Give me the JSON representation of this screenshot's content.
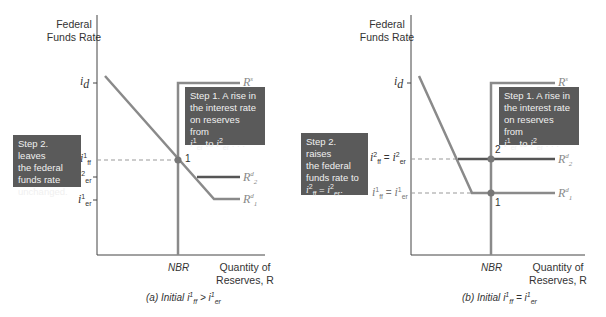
{
  "top_fragment": "",
  "panel_a": {
    "y_axis_title_line1": "Federal",
    "y_axis_title_line2": "Funds Rate",
    "x_axis_title_line1": "Quantity of",
    "x_axis_title_line2": "Reserves, R",
    "nbr_label": "NBR",
    "id_label": "i",
    "id_sub": "d",
    "iff1_label": "i",
    "iff1_sup": "1",
    "iff1_sub": "ff",
    "ier2_label": "i",
    "ier2_sup": "2",
    "ier2_sub": "er",
    "ier1_label": "i",
    "ier1_sup": "1",
    "ier1_sub": "er",
    "rs_label": "R",
    "rs_sup": "s",
    "r2d_label": "R",
    "r2d_sub": "2",
    "r2d_sup": "d",
    "r1d_label": "R",
    "r1d_sub": "1",
    "r1d_sup": "d",
    "point1": "1",
    "step1_box": {
      "line1": "Step 1. A rise in",
      "line2": "the interest rate",
      "line3": "on reserves from",
      "line4_a": "i",
      "line4_a_sup": "1",
      "line4_a_sub": "er",
      "line4_mid": " to ",
      "line4_b": "i",
      "line4_b_sup": "2",
      "line4_b_sub": "er",
      "line4_end": " . . ."
    },
    "step2_box": {
      "line1": "Step 2. leaves",
      "line2": "the federal",
      "line3": "funds rate",
      "line4": "unchanged."
    },
    "caption_prefix": "(a) Initial ",
    "caption_i1": "i",
    "caption_i1_sup": "1",
    "caption_i1_sub": "ff",
    "caption_op": " > ",
    "caption_i2": "i",
    "caption_i2_sup": "1",
    "caption_i2_sub": "er"
  },
  "panel_b": {
    "y_axis_title_line1": "Federal",
    "y_axis_title_line2": "Funds Rate",
    "x_axis_title_line1": "Quantity of",
    "x_axis_title_line2": "Reserves, R",
    "nbr_label": "NBR",
    "id_label": "i",
    "id_sub": "d",
    "level2_label": "i",
    "level2_sup": "2",
    "level2_sub": "ff",
    "level2_eq": " = ",
    "level2_b": "i",
    "level2_b_sup": "2",
    "level2_b_sub": "er",
    "level1_label": "i",
    "level1_sup": "1",
    "level1_sub": "ff",
    "level1_eq": " = ",
    "level1_b": "i",
    "level1_b_sup": "1",
    "level1_b_sub": "er",
    "rs_label": "R",
    "rs_sup": "s",
    "r2d_label": "R",
    "r2d_sub": "2",
    "r2d_sup": "d",
    "r1d_label": "R",
    "r1d_sub": "1",
    "r1d_sup": "d",
    "point1": "1",
    "point2": "2",
    "step1_box": {
      "line1": "Step 1. A rise in",
      "line2": "the interest rate",
      "line3": "on reserves from",
      "line4_a": "i",
      "line4_a_sup": "1",
      "line4_a_sub": "er",
      "line4_mid": " to ",
      "line4_b": "i",
      "line4_b_sup": "2",
      "line4_b_sub": "er",
      "line4_end": " . . ."
    },
    "step2_box": {
      "line1": "Step 2. raises",
      "line2": "the federal",
      "line3": "funds rate to",
      "line4_a": "i",
      "line4_a_sup": "2",
      "line4_a_sub": "ff",
      "line4_eq": " = ",
      "line4_b": "i",
      "line4_b_sup": "2",
      "line4_b_sub": "er",
      "line4_end": "."
    },
    "caption_prefix": "(b) Initial ",
    "caption_i1": "i",
    "caption_i1_sup": "1",
    "caption_i1_sub": "ff",
    "caption_op": " = ",
    "caption_i2": "i",
    "caption_i2_sup": "1",
    "caption_i2_sub": "er"
  },
  "colors": {
    "supply_curve": "#8a8a8a",
    "demand_curve_1": "#8a8a8a",
    "demand_curve_2": "#555555",
    "axis": "#444444",
    "box_fill": "#5a5a5a",
    "box_text": "#f0f0f0",
    "dashed": "#999999"
  }
}
